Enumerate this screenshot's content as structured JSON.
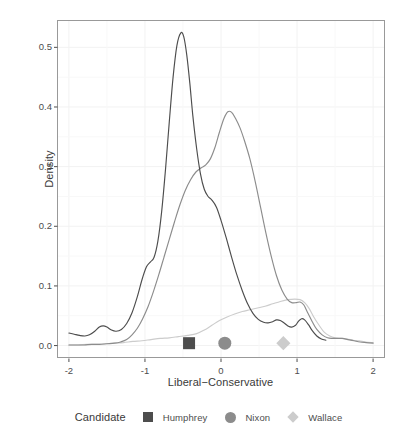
{
  "chart_data": {
    "type": "line",
    "title": "",
    "xlabel": "Liberal−Conservative",
    "ylabel": "Density",
    "xlim": [
      -2.15,
      2.15
    ],
    "ylim": [
      -0.02,
      0.545
    ],
    "xticks": [
      -2,
      -1,
      0,
      1,
      2
    ],
    "xtick_labels": [
      "-2",
      "-1",
      "0",
      "1",
      "2"
    ],
    "yticks": [
      0.0,
      0.1,
      0.2,
      0.3,
      0.4,
      0.5
    ],
    "ytick_labels": [
      "0.0",
      "0.1",
      "0.2",
      "0.3",
      "0.4",
      "0.5"
    ],
    "grid": true,
    "grid_color": "#f2f2f2",
    "panel_background": "#ffffff",
    "panel_border_color": "#999999",
    "legend": {
      "title": "Candidate",
      "position": "bottom",
      "entries": [
        {
          "name": "Humphrey",
          "marker": "square",
          "color": "#4d4d4d"
        },
        {
          "name": "Nixon",
          "marker": "circle",
          "color": "#8c8c8c"
        },
        {
          "name": "Wallace",
          "marker": "diamond",
          "color": "#cccccc"
        }
      ]
    },
    "markers": [
      {
        "name": "Humphrey",
        "x": -0.42,
        "y": 0.004,
        "marker": "square",
        "color": "#4d4d4d"
      },
      {
        "name": "Nixon",
        "x": 0.05,
        "y": 0.004,
        "marker": "circle",
        "color": "#8c8c8c"
      },
      {
        "name": "Wallace",
        "x": 0.82,
        "y": 0.004,
        "marker": "diamond",
        "color": "#cccccc"
      }
    ],
    "series": [
      {
        "name": "Humphrey",
        "color": "#4d4d4d",
        "points": [
          [
            -2.0,
            0.021
          ],
          [
            -1.93,
            0.019
          ],
          [
            -1.86,
            0.017
          ],
          [
            -1.79,
            0.016
          ],
          [
            -1.73,
            0.018
          ],
          [
            -1.66,
            0.024
          ],
          [
            -1.6,
            0.031
          ],
          [
            -1.55,
            0.033
          ],
          [
            -1.5,
            0.031
          ],
          [
            -1.44,
            0.026
          ],
          [
            -1.38,
            0.024
          ],
          [
            -1.31,
            0.027
          ],
          [
            -1.24,
            0.037
          ],
          [
            -1.17,
            0.055
          ],
          [
            -1.1,
            0.082
          ],
          [
            -1.04,
            0.11
          ],
          [
            -0.98,
            0.132
          ],
          [
            -0.93,
            0.14
          ],
          [
            -0.88,
            0.148
          ],
          [
            -0.83,
            0.175
          ],
          [
            -0.78,
            0.225
          ],
          [
            -0.73,
            0.295
          ],
          [
            -0.68,
            0.375
          ],
          [
            -0.63,
            0.45
          ],
          [
            -0.58,
            0.503
          ],
          [
            -0.53,
            0.524
          ],
          [
            -0.49,
            0.518
          ],
          [
            -0.45,
            0.487
          ],
          [
            -0.41,
            0.44
          ],
          [
            -0.37,
            0.385
          ],
          [
            -0.32,
            0.33
          ],
          [
            -0.27,
            0.288
          ],
          [
            -0.22,
            0.262
          ],
          [
            -0.17,
            0.25
          ],
          [
            -0.12,
            0.244
          ],
          [
            -0.06,
            0.232
          ],
          [
            0.0,
            0.21
          ],
          [
            0.07,
            0.18
          ],
          [
            0.14,
            0.148
          ],
          [
            0.21,
            0.118
          ],
          [
            0.28,
            0.092
          ],
          [
            0.35,
            0.07
          ],
          [
            0.42,
            0.054
          ],
          [
            0.49,
            0.044
          ],
          [
            0.56,
            0.039
          ],
          [
            0.62,
            0.038
          ],
          [
            0.68,
            0.04
          ],
          [
            0.73,
            0.043
          ],
          [
            0.78,
            0.042
          ],
          [
            0.83,
            0.038
          ],
          [
            0.88,
            0.033
          ],
          [
            0.93,
            0.031
          ],
          [
            0.98,
            0.034
          ],
          [
            1.02,
            0.041
          ],
          [
            1.06,
            0.045
          ],
          [
            1.1,
            0.043
          ],
          [
            1.15,
            0.035
          ],
          [
            1.2,
            0.025
          ],
          [
            1.26,
            0.016
          ],
          [
            1.32,
            0.011
          ],
          [
            1.38,
            0.009
          ]
        ]
      },
      {
        "name": "Nixon",
        "color": "#8c8c8c",
        "points": [
          [
            -2.0,
            0.001
          ],
          [
            -1.9,
            0.001
          ],
          [
            -1.8,
            0.001
          ],
          [
            -1.7,
            0.002
          ],
          [
            -1.6,
            0.002
          ],
          [
            -1.5,
            0.003
          ],
          [
            -1.4,
            0.004
          ],
          [
            -1.32,
            0.006
          ],
          [
            -1.24,
            0.01
          ],
          [
            -1.17,
            0.018
          ],
          [
            -1.1,
            0.029
          ],
          [
            -1.03,
            0.045
          ],
          [
            -0.96,
            0.065
          ],
          [
            -0.89,
            0.09
          ],
          [
            -0.82,
            0.118
          ],
          [
            -0.75,
            0.148
          ],
          [
            -0.68,
            0.178
          ],
          [
            -0.61,
            0.208
          ],
          [
            -0.54,
            0.236
          ],
          [
            -0.47,
            0.26
          ],
          [
            -0.4,
            0.278
          ],
          [
            -0.33,
            0.291
          ],
          [
            -0.26,
            0.298
          ],
          [
            -0.2,
            0.303
          ],
          [
            -0.14,
            0.313
          ],
          [
            -0.08,
            0.332
          ],
          [
            -0.02,
            0.358
          ],
          [
            0.04,
            0.381
          ],
          [
            0.09,
            0.392
          ],
          [
            0.14,
            0.391
          ],
          [
            0.19,
            0.381
          ],
          [
            0.25,
            0.365
          ],
          [
            0.31,
            0.343
          ],
          [
            0.38,
            0.313
          ],
          [
            0.45,
            0.275
          ],
          [
            0.52,
            0.232
          ],
          [
            0.59,
            0.189
          ],
          [
            0.66,
            0.15
          ],
          [
            0.73,
            0.117
          ],
          [
            0.8,
            0.093
          ],
          [
            0.87,
            0.078
          ],
          [
            0.93,
            0.072
          ],
          [
            0.99,
            0.072
          ],
          [
            1.04,
            0.073
          ],
          [
            1.09,
            0.068
          ],
          [
            1.14,
            0.055
          ],
          [
            1.2,
            0.04
          ],
          [
            1.26,
            0.027
          ],
          [
            1.33,
            0.018
          ],
          [
            1.4,
            0.013
          ],
          [
            1.47,
            0.012
          ],
          [
            1.53,
            0.012
          ],
          [
            1.6,
            0.012
          ],
          [
            1.67,
            0.01
          ],
          [
            1.75,
            0.008
          ],
          [
            1.83,
            0.006
          ],
          [
            1.91,
            0.005
          ],
          [
            2.0,
            0.004
          ]
        ]
      },
      {
        "name": "Wallace",
        "color": "#cccccc",
        "points": [
          [
            -2.0,
            0.001
          ],
          [
            -1.88,
            0.001
          ],
          [
            -1.76,
            0.002
          ],
          [
            -1.64,
            0.002
          ],
          [
            -1.52,
            0.003
          ],
          [
            -1.4,
            0.004
          ],
          [
            -1.28,
            0.005
          ],
          [
            -1.16,
            0.007
          ],
          [
            -1.04,
            0.008
          ],
          [
            -0.92,
            0.01
          ],
          [
            -0.8,
            0.012
          ],
          [
            -0.68,
            0.013
          ],
          [
            -0.56,
            0.015
          ],
          [
            -0.44,
            0.017
          ],
          [
            -0.32,
            0.02
          ],
          [
            -0.22,
            0.026
          ],
          [
            -0.12,
            0.034
          ],
          [
            -0.02,
            0.042
          ],
          [
            0.08,
            0.048
          ],
          [
            0.18,
            0.053
          ],
          [
            0.28,
            0.057
          ],
          [
            0.38,
            0.06
          ],
          [
            0.48,
            0.063
          ],
          [
            0.58,
            0.066
          ],
          [
            0.68,
            0.07
          ],
          [
            0.78,
            0.074
          ],
          [
            0.88,
            0.077
          ],
          [
            0.97,
            0.078
          ],
          [
            1.04,
            0.077
          ],
          [
            1.1,
            0.072
          ],
          [
            1.16,
            0.062
          ],
          [
            1.22,
            0.048
          ],
          [
            1.29,
            0.034
          ],
          [
            1.36,
            0.022
          ],
          [
            1.43,
            0.016
          ],
          [
            1.5,
            0.013
          ],
          [
            1.58,
            0.012
          ],
          [
            1.66,
            0.011
          ],
          [
            1.74,
            0.009
          ],
          [
            1.82,
            0.008
          ],
          [
            1.9,
            0.006
          ],
          [
            2.0,
            0.005
          ]
        ]
      }
    ]
  }
}
